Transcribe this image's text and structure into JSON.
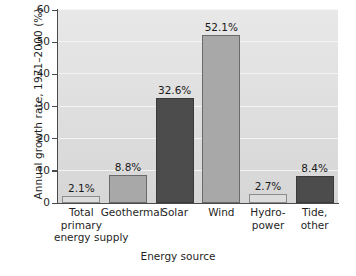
{
  "chart_data": {
    "type": "bar",
    "title": "",
    "xlabel": "Energy source",
    "ylabel": "Annual growth rate, 1971–2000 (%)",
    "ylim": [
      0,
      60
    ],
    "yticks": [
      0,
      10,
      20,
      30,
      40,
      50,
      60
    ],
    "ytick_labels": [
      "0",
      "10",
      "20",
      "30",
      "40",
      "50",
      "60"
    ],
    "grid": true,
    "legend": "none",
    "categories": [
      "Total primary energy supply",
      "Geothermal",
      "Solar",
      "Wind",
      "Hydro-power",
      "Tide, other"
    ],
    "category_lines": [
      [
        "Total",
        "primary",
        "energy supply"
      ],
      [
        "Geothermal"
      ],
      [
        "Solar"
      ],
      [
        "Wind"
      ],
      [
        "Hydro-",
        "power"
      ],
      [
        "Tide,",
        "other"
      ]
    ],
    "values": [
      2.1,
      8.8,
      32.6,
      52.1,
      2.7,
      8.4
    ],
    "value_labels": [
      "2.1%",
      "8.8%",
      "32.6%",
      "52.1%",
      "2.7%",
      "8.4%"
    ],
    "bar_shades": [
      "light",
      "medium",
      "dark",
      "medium",
      "light",
      "dark"
    ],
    "colors": {
      "light": "#dcdcdc",
      "medium": "#a8a8a8",
      "dark": "#4c4c4c",
      "plot_background": "#e0e0e0",
      "gridline": "#f6f6f6",
      "axis": "#4a4a4a",
      "text": "#1f1f1f"
    }
  }
}
